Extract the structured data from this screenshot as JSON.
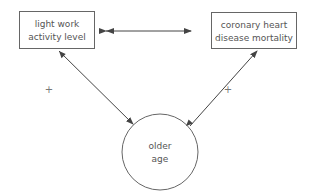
{
  "diagram": {
    "nodes": [
      {
        "id": "light-work",
        "shape": "rectangle",
        "lines": [
          "light work",
          "activity level"
        ]
      },
      {
        "id": "chd-mortality",
        "shape": "rectangle",
        "lines": [
          "coronary heart",
          "disease mortality"
        ]
      },
      {
        "id": "older-age",
        "shape": "circle",
        "lines": [
          "older",
          "age"
        ]
      }
    ],
    "edges": [
      {
        "from": "light-work",
        "to": "chd-mortality",
        "type": "double-arrow",
        "label": ""
      },
      {
        "from": "older-age",
        "to": "light-work",
        "type": "double-arrow",
        "label": "+"
      },
      {
        "from": "older-age",
        "to": "chd-mortality",
        "type": "single-arrow",
        "label": "+"
      }
    ],
    "colors": {
      "stroke": "#555555",
      "text": "#555555"
    }
  }
}
